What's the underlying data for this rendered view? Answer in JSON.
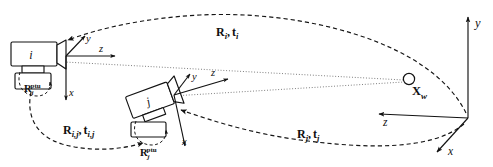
{
  "figure": {
    "background_color": "#ffffff",
    "ink_color": "#121212",
    "width": 493,
    "height": 167
  },
  "cameras": [
    {
      "id": "camera-i",
      "body_label": "i",
      "ptu_label_base": "R",
      "ptu_label_sub": "i",
      "ptu_label_sup": "ptu",
      "axes": {
        "y": "y",
        "z": "z",
        "x": "x"
      }
    },
    {
      "id": "camera-j",
      "body_label": "j",
      "ptu_label_base": "R",
      "ptu_label_sub": "j",
      "ptu_label_sup": "ptu",
      "axes": {
        "y": "y",
        "z": "z",
        "x": "x"
      }
    }
  ],
  "world_frame": {
    "name": "world-coordinate-frame",
    "axes": {
      "y": "y",
      "z": "z",
      "x": "x"
    }
  },
  "world_point": {
    "name": "world-point",
    "label_base": "X",
    "label_sub": "w"
  },
  "transforms": [
    {
      "id": "transform-i",
      "label": "R_i, t_i",
      "rot_base": "R",
      "rot_sub": "i",
      "trans_base": "t",
      "trans_sub": "i",
      "separator": ",",
      "from": "world-origin",
      "to": "camera-i"
    },
    {
      "id": "transform-ij",
      "label": "R_i,j, t_i,j",
      "rot_base": "R",
      "rot_sub": "i,j",
      "trans_base": "t",
      "trans_sub": "i,j",
      "separator": ",",
      "from": "camera-i",
      "to": "camera-j"
    },
    {
      "id": "transform-j",
      "label": "R_j, t_j",
      "rot_base": "R",
      "rot_sub": "j",
      "trans_base": "t",
      "trans_sub": "j",
      "separator": ",",
      "from": "world-origin",
      "to": "camera-j"
    }
  ],
  "sight_lines": [
    {
      "id": "sight-line-i",
      "from": "camera-i",
      "to": "world-point"
    },
    {
      "id": "sight-line-j",
      "from": "camera-j",
      "to": "world-point"
    }
  ]
}
